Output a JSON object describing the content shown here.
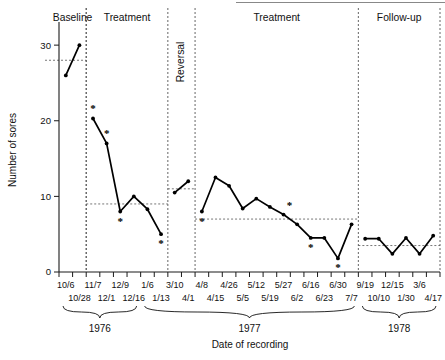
{
  "chart_data": {
    "type": "line",
    "title": "",
    "xlabel": "Date of recording",
    "ylabel": "Number of sores",
    "ylim": [
      0,
      32
    ],
    "yticks": [
      0,
      10,
      20,
      30
    ],
    "grid": false,
    "legend": "none",
    "x_tick_labels": [
      "10/6",
      "10/28",
      "11/7",
      "12/1",
      "12/9",
      "12/16",
      "1/6",
      "1/13",
      "3/10",
      "4/1",
      "4/8",
      "4/15",
      "4/26",
      "5/5",
      "5/12",
      "5/19",
      "5/27",
      "6/2",
      "6/16",
      "6/23",
      "6/30",
      "7/7",
      "9/19",
      "10/10",
      "12/15",
      "1/30",
      "3/6",
      "4/17"
    ],
    "x_tick_rows": [
      "top",
      "bottom",
      "top",
      "bottom",
      "top",
      "bottom",
      "top",
      "bottom",
      "top",
      "bottom",
      "top",
      "bottom",
      "top",
      "bottom",
      "top",
      "bottom",
      "top",
      "bottom",
      "top",
      "bottom",
      "top",
      "bottom",
      "top",
      "bottom",
      "top",
      "bottom",
      "top",
      "bottom"
    ],
    "year_groups": [
      {
        "label": "1976",
        "start_index": 0,
        "end_index": 5
      },
      {
        "label": "1977",
        "start_index": 6,
        "end_index": 21
      },
      {
        "label": "1978",
        "start_index": 22,
        "end_index": 27
      }
    ],
    "phases": [
      {
        "label": "Baseline",
        "start_index": 0,
        "end_index": 1,
        "orientation": "horizontal",
        "mean_level": 28
      },
      {
        "label": "Treatment",
        "start_index": 2,
        "end_index": 7,
        "orientation": "horizontal",
        "mean_level": 9
      },
      {
        "label": "Reversal",
        "start_index": 8,
        "end_index": 9,
        "orientation": "vertical",
        "mean_level": 11
      },
      {
        "label": "Treatment",
        "start_index": 10,
        "end_index": 21,
        "orientation": "horizontal",
        "mean_level": 7
      },
      {
        "label": "Follow-up",
        "start_index": 22,
        "end_index": 27,
        "orientation": "horizontal",
        "mean_level": 3.5
      }
    ],
    "series": [
      {
        "name": "Number of sores",
        "points": [
          {
            "x_label": "10/6",
            "y": 26,
            "starred": false
          },
          {
            "x_label": "10/28",
            "y": 30,
            "starred": false
          },
          {
            "x_label": "11/7",
            "y": 20.3,
            "starred": true
          },
          {
            "x_label": "12/1",
            "y": 17,
            "starred": true
          },
          {
            "x_label": "12/9",
            "y": 8,
            "starred": true
          },
          {
            "x_label": "12/16",
            "y": 10,
            "starred": false
          },
          {
            "x_label": "1/6",
            "y": 8.3,
            "starred": false
          },
          {
            "x_label": "1/13",
            "y": 5,
            "starred": true
          },
          {
            "x_label": "3/10",
            "y": 10.5,
            "starred": false
          },
          {
            "x_label": "4/1",
            "y": 12,
            "starred": false
          },
          {
            "x_label": "4/8",
            "y": 8,
            "starred": true
          },
          {
            "x_label": "4/15",
            "y": 12.5,
            "starred": false
          },
          {
            "x_label": "4/26",
            "y": 11.4,
            "starred": false
          },
          {
            "x_label": "5/5",
            "y": 8.4,
            "starred": false
          },
          {
            "x_label": "5/12",
            "y": 9.7,
            "starred": false
          },
          {
            "x_label": "5/19",
            "y": 8.6,
            "starred": false
          },
          {
            "x_label": "5/27",
            "y": 7.6,
            "starred": true
          },
          {
            "x_label": "6/2",
            "y": 6.3,
            "starred": false
          },
          {
            "x_label": "6/16",
            "y": 4.5,
            "starred": true
          },
          {
            "x_label": "6/23",
            "y": 4.5,
            "starred": false
          },
          {
            "x_label": "6/30",
            "y": 1.8,
            "starred": true
          },
          {
            "x_label": "7/7",
            "y": 6.3,
            "starred": false
          },
          {
            "x_label": "9/19",
            "y": 4.4,
            "starred": false
          },
          {
            "x_label": "10/10",
            "y": 4.4,
            "starred": false
          },
          {
            "x_label": "12/15",
            "y": 2.4,
            "starred": false
          },
          {
            "x_label": "1/30",
            "y": 4.5,
            "starred": false
          },
          {
            "x_label": "3/6",
            "y": 2.4,
            "starred": false
          },
          {
            "x_label": "4/17",
            "y": 4.8,
            "starred": false
          }
        ]
      }
    ],
    "annotations": {
      "asterisk_glyph": "*",
      "asterisk_meaning": ""
    }
  },
  "colors": {
    "data_line": "#000000",
    "axis": "#1a1a1a",
    "phase_divider": "#555555",
    "level_line": "#666666",
    "background": "#ffffff"
  }
}
